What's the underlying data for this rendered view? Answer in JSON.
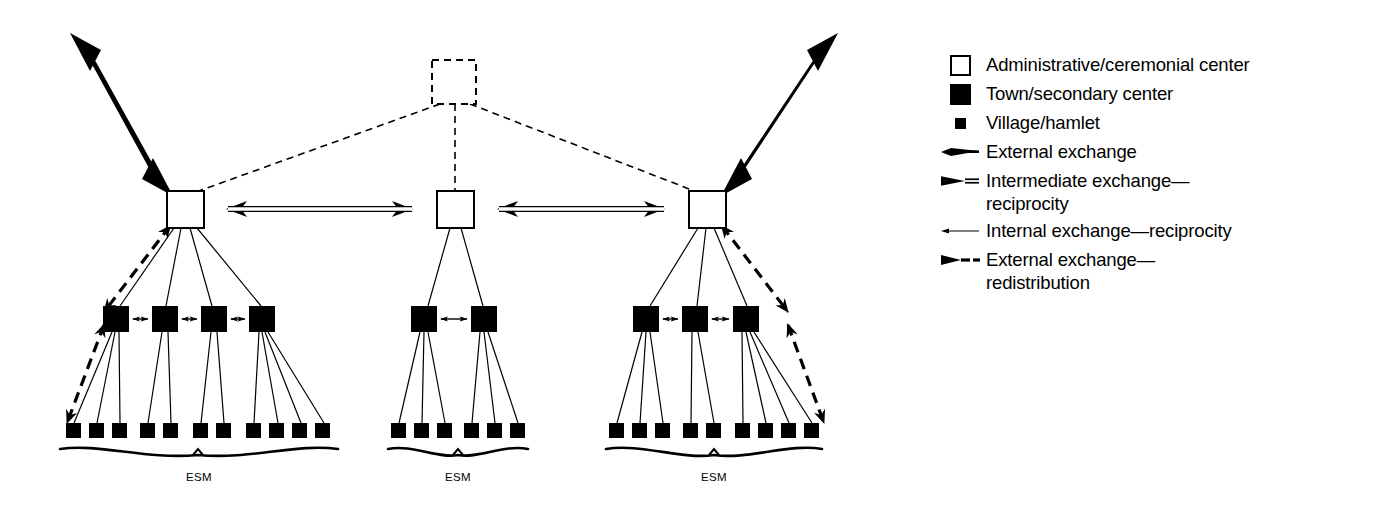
{
  "diagram": {
    "kind": "settlement-hierarchy-exchange-network",
    "background_color": "#ffffff",
    "ink_color": "#000000",
    "clusters": [
      {
        "id": "left",
        "esm_label": "ESM",
        "admin_center": {
          "x": 185,
          "y": 209
        },
        "towns": [
          {
            "x": 116,
            "y": 319
          },
          {
            "x": 165,
            "y": 319
          },
          {
            "x": 214,
            "y": 319
          },
          {
            "x": 262,
            "y": 319
          }
        ],
        "villages": [
          {
            "x": 73,
            "y": 430
          },
          {
            "x": 96,
            "y": 430
          },
          {
            "x": 119,
            "y": 430
          },
          {
            "x": 147,
            "y": 430
          },
          {
            "x": 170,
            "y": 430
          },
          {
            "x": 200,
            "y": 430
          },
          {
            "x": 223,
            "y": 430
          },
          {
            "x": 253,
            "y": 430
          },
          {
            "x": 277,
            "y": 430
          },
          {
            "x": 300,
            "y": 430
          },
          {
            "x": 323,
            "y": 430
          }
        ],
        "town_to_villages": [
          [
            0,
            1,
            2
          ],
          [
            3,
            4
          ],
          [
            5,
            6
          ],
          [
            7,
            8,
            9,
            10
          ]
        ],
        "brace": {
          "left": 60,
          "right": 338,
          "y": 450
        },
        "esm_x": 199,
        "esm_y": 478
      },
      {
        "id": "middle",
        "esm_label": "ESM",
        "admin_center": {
          "x": 455,
          "y": 209
        },
        "towns": [
          {
            "x": 424,
            "y": 319
          },
          {
            "x": 484,
            "y": 319
          }
        ],
        "villages": [
          {
            "x": 398,
            "y": 430
          },
          {
            "x": 421,
            "y": 430
          },
          {
            "x": 444,
            "y": 430
          },
          {
            "x": 471,
            "y": 430
          },
          {
            "x": 494,
            "y": 430
          },
          {
            "x": 517,
            "y": 430
          }
        ],
        "town_to_villages": [
          [
            0,
            1,
            2
          ],
          [
            3,
            4,
            5
          ]
        ],
        "brace": {
          "left": 388,
          "right": 528,
          "y": 450
        },
        "esm_x": 458,
        "esm_y": 478
      },
      {
        "id": "right",
        "esm_label": "ESM",
        "admin_center": {
          "x": 707,
          "y": 209
        },
        "towns": [
          {
            "x": 646,
            "y": 319
          },
          {
            "x": 695,
            "y": 319
          },
          {
            "x": 746,
            "y": 319
          }
        ],
        "villages": [
          {
            "x": 616,
            "y": 430
          },
          {
            "x": 639,
            "y": 430
          },
          {
            "x": 662,
            "y": 430
          },
          {
            "x": 690,
            "y": 430
          },
          {
            "x": 713,
            "y": 430
          },
          {
            "x": 742,
            "y": 430
          },
          {
            "x": 765,
            "y": 430
          },
          {
            "x": 788,
            "y": 430
          },
          {
            "x": 811,
            "y": 430
          }
        ],
        "town_to_villages": [
          [
            0,
            1,
            2
          ],
          [
            3,
            4
          ],
          [
            5,
            6,
            7,
            8
          ]
        ],
        "brace": {
          "left": 606,
          "right": 822,
          "y": 450
        },
        "esm_x": 714,
        "esm_y": 478
      }
    ],
    "apex_node": {
      "x": 455,
      "y": 82,
      "style": "dashed-open-square"
    },
    "external_arrows": [
      {
        "id": "left-external",
        "from": {
          "x": 70,
          "y": 33
        },
        "to": {
          "x": 170,
          "y": 193
        }
      },
      {
        "id": "right-external",
        "from": {
          "x": 838,
          "y": 33
        },
        "to": {
          "x": 722,
          "y": 193
        }
      }
    ],
    "intermediate_arrows": [
      {
        "id": "left-middle",
        "from": {
          "x": 206,
          "y": 209
        },
        "to": {
          "x": 434,
          "y": 209
        }
      },
      {
        "id": "middle-right",
        "from": {
          "x": 477,
          "y": 209
        },
        "to": {
          "x": 686,
          "y": 209
        }
      }
    ]
  },
  "legend": {
    "items": [
      {
        "symbol": "open-square",
        "label": "Administrative/ceremonial center"
      },
      {
        "symbol": "filled-square-large",
        "label": "Town/secondary center"
      },
      {
        "symbol": "filled-square-small",
        "label": "Village/hamlet"
      },
      {
        "symbol": "solid-thick-arrow",
        "label": "External exchange"
      },
      {
        "symbol": "hollow-shaft-arrow",
        "label": "Intermediate exchange—\nreciprocity"
      },
      {
        "symbol": "thin-line-arrow",
        "label": "Internal exchange—reciprocity"
      },
      {
        "symbol": "dashed-arrow",
        "label": "External exchange—\nredistribution"
      }
    ]
  }
}
